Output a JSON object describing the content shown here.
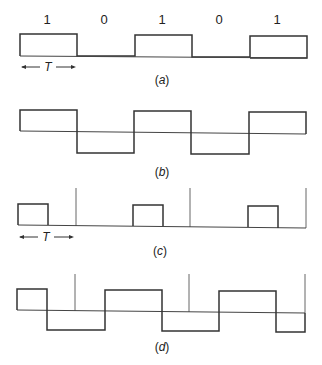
{
  "figure": {
    "bits": [
      "1",
      "0",
      "1",
      "0",
      "1"
    ],
    "period_label": "T",
    "captions": {
      "a": "a",
      "b": "b",
      "c": "c",
      "d": "d"
    },
    "panels": [
      {
        "id": "a",
        "description": "Unipolar NRZ: high for bit 1, zero for bit 0, full bit period T"
      },
      {
        "id": "b",
        "description": "Polar NRZ: positive for bit 1, negative for bit 0"
      },
      {
        "id": "c",
        "description": "Unipolar RZ: half-width pulse for bit 1, with bit-boundary markers"
      },
      {
        "id": "d",
        "description": "Manchester-like split-phase code with bit-boundary markers"
      }
    ],
    "colors": {
      "line": "#333333",
      "marker": "#666666",
      "background": "#ffffff"
    }
  }
}
